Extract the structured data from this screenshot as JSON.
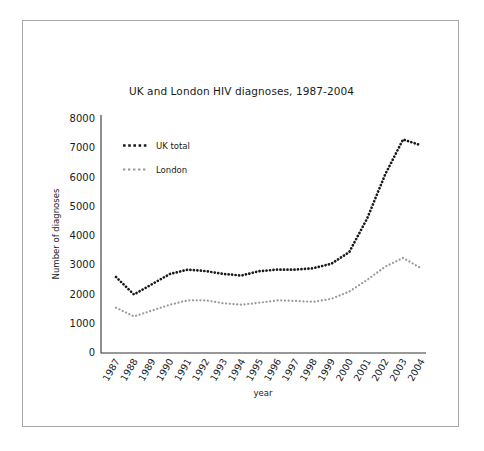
{
  "chart_data": {
    "type": "line",
    "title": "UK and London HIV diagnoses, 1987-2004",
    "xlabel": "year",
    "ylabel": "Number of diagnoses",
    "grid": false,
    "legend_position": "upper-left-inside",
    "ylim": [
      0,
      8000
    ],
    "ytick_labels": [
      "0",
      "1000",
      "2000",
      "3000",
      "4000",
      "5000",
      "6000",
      "7000",
      "8000"
    ],
    "yticks": [
      0,
      1000,
      2000,
      3000,
      4000,
      5000,
      6000,
      7000,
      8000
    ],
    "categories": [
      "1987",
      "1988",
      "1989",
      "1990",
      "1991",
      "1992",
      "1993",
      "1994",
      "1995",
      "1996",
      "1997",
      "1998",
      "1999",
      "2000",
      "2001",
      "2002",
      "2003",
      "2004"
    ],
    "x": [
      1987,
      1988,
      1989,
      1990,
      1991,
      1992,
      1993,
      1994,
      1995,
      1996,
      1997,
      1998,
      1999,
      2000,
      2001,
      2002,
      2003,
      2004
    ],
    "series": [
      {
        "name": "UK total",
        "color": "#1a1a1a",
        "linestyle": "dotted",
        "values": [
          2600,
          2000,
          2350,
          2700,
          2850,
          2800,
          2700,
          2650,
          2800,
          2850,
          2850,
          2900,
          3050,
          3450,
          4600,
          6100,
          7300,
          7100
        ]
      },
      {
        "name": "London",
        "color": "#9a9a9a",
        "linestyle": "dotted",
        "values": [
          1550,
          1250,
          1450,
          1650,
          1800,
          1800,
          1700,
          1650,
          1720,
          1800,
          1780,
          1750,
          1850,
          2100,
          2500,
          2950,
          3250,
          2900
        ]
      }
    ]
  },
  "legend": {
    "entries": [
      {
        "label": "UK total"
      },
      {
        "label": "London"
      }
    ]
  }
}
